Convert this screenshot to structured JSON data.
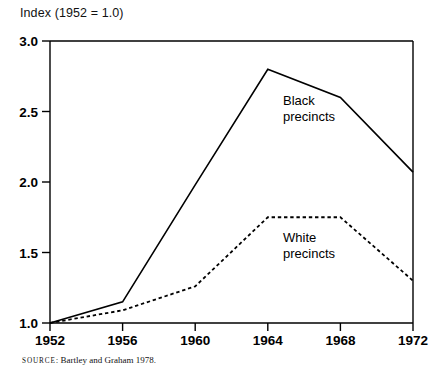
{
  "chart_data": {
    "type": "line",
    "title": "Index (1952 = 1.0)",
    "xlabel": "",
    "ylabel": "",
    "x": [
      1952,
      1956,
      1960,
      1964,
      1968,
      1972
    ],
    "xlim": [
      1952,
      1972
    ],
    "ylim": [
      1.0,
      3.0
    ],
    "xticks": [
      "1952",
      "1956",
      "1960",
      "1964",
      "1968",
      "1972"
    ],
    "yticks": [
      "1.0",
      "1.5",
      "2.0",
      "2.5",
      "3.0"
    ],
    "grid": false,
    "legend_position": "inline-annotations",
    "series": [
      {
        "name": "Black precincts",
        "style": "solid",
        "color": "#000000",
        "values": [
          1.0,
          1.15,
          1.98,
          2.8,
          2.6,
          2.07
        ]
      },
      {
        "name": "White precincts",
        "style": "dashed",
        "color": "#000000",
        "values": [
          1.0,
          1.09,
          1.26,
          1.75,
          1.75,
          1.3
        ]
      }
    ],
    "annotations": [
      {
        "text_line1": "Black",
        "text_line2": "precincts",
        "x": 1964.6,
        "y": 2.52
      },
      {
        "text_line1": "White",
        "text_line2": "precincts",
        "x": 1964.6,
        "y": 1.55
      }
    ]
  },
  "source": {
    "label": "SOURCE",
    "text": ": Bartley and Graham 1978."
  }
}
